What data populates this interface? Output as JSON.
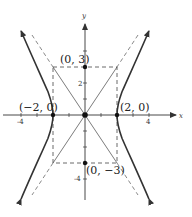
{
  "diagram": {
    "axes": {
      "x_label": "x",
      "y_label": "y"
    },
    "ticks": {
      "x": [
        {
          "value": -4,
          "label": "-4"
        },
        {
          "value": 4,
          "label": "4"
        }
      ],
      "y": [
        {
          "value": 2,
          "label": "2"
        },
        {
          "value": -4,
          "label": "-4"
        }
      ]
    },
    "points": [
      {
        "name": "top",
        "label": "(0, 3)",
        "x": 0,
        "y": 3
      },
      {
        "name": "bottom",
        "label": "(0, −3)",
        "x": 0,
        "y": -3
      },
      {
        "name": "left-vertex",
        "label": "(−2, 0)",
        "x": -2,
        "y": 0
      },
      {
        "name": "right-vertex",
        "label": "(2, 0)",
        "x": 2,
        "y": 0
      },
      {
        "name": "origin",
        "label": "",
        "x": 0,
        "y": 0
      }
    ],
    "colors": {
      "curve": "#333333",
      "axis": "#333333",
      "dashed": "#555555"
    }
  }
}
